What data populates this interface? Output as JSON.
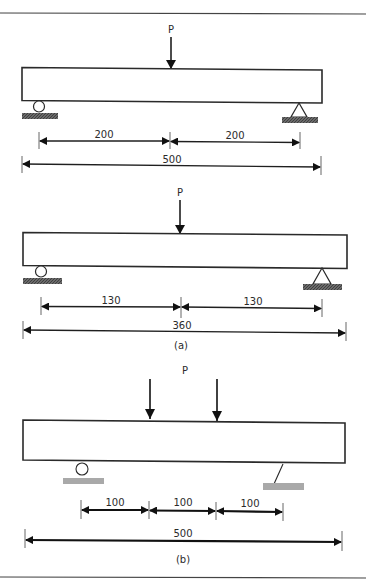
{
  "figure": {
    "top_rule": true,
    "bottom_rule": true,
    "colors": {
      "line": "#2a2a2a",
      "hatch_dark": "#555555",
      "ground_light": "#aaaaaa",
      "background": "#ffffff"
    }
  },
  "diagram_1": {
    "load_label": "P",
    "loads": 1,
    "span_dims": [
      "200",
      "200"
    ],
    "total_dim": "500",
    "supports": [
      "roller",
      "pin"
    ]
  },
  "diagram_a": {
    "load_label": "P",
    "loads": 1,
    "span_dims": [
      "130",
      "130"
    ],
    "total_dim": "360",
    "caption": "(a)",
    "supports": [
      "roller",
      "pin"
    ]
  },
  "diagram_b": {
    "load_label": "P",
    "loads": 2,
    "span_dims": [
      "100",
      "100",
      "100"
    ],
    "total_dim": "500",
    "caption": "(b)",
    "supports": [
      "roller",
      "pin"
    ]
  }
}
